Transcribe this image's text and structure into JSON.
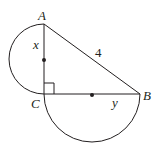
{
  "diagram": {
    "type": "geometry",
    "points": {
      "A": {
        "label": "A",
        "x": 44,
        "y": 24
      },
      "B": {
        "label": "B",
        "x": 140,
        "y": 94
      },
      "C": {
        "label": "C",
        "x": 44,
        "y": 94
      }
    },
    "segments": [
      {
        "from": "A",
        "to": "B",
        "label": "4"
      },
      {
        "from": "A",
        "to": "C",
        "label": "x"
      },
      {
        "from": "C",
        "to": "B",
        "label": "y"
      }
    ],
    "semicircles": [
      {
        "diameter": "AC",
        "side": "left",
        "center_dot": true
      },
      {
        "diameter": "CB",
        "side": "below",
        "center_dot": true
      }
    ],
    "right_angle_marker": "C",
    "labels": {
      "A": "A",
      "B": "B",
      "C": "C",
      "x": "x",
      "y": "y",
      "hypotenuse": "4"
    },
    "colors": {
      "stroke": "#231f20",
      "background": "#ffffff"
    }
  }
}
